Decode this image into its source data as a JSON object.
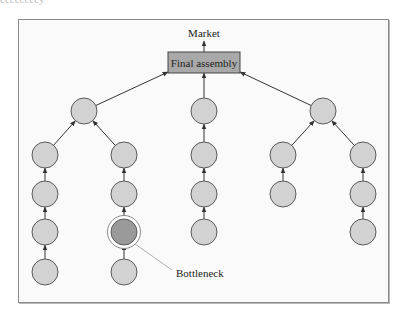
{
  "caption_fragment": "ccccccccy",
  "diagram": {
    "market_label": "Market",
    "final_assembly_label": "Final assembly",
    "bottleneck_label": "Bottleneck",
    "colors": {
      "frame_bg": "#fafafa",
      "node_fill": "#d2d2d2",
      "node_stroke": "#5a5a5a",
      "bottleneck_fill": "#9a9a9a",
      "box_fill": "#a9a9a9",
      "line": "#333333",
      "leader_line": "#b0b0b0"
    },
    "final_assembly_box": {
      "x": 168,
      "y": 52,
      "w": 72,
      "h": 21
    },
    "node_radius": 13,
    "nodes": [
      {
        "id": "top-left",
        "x": 84,
        "y": 111
      },
      {
        "id": "top-mid",
        "x": 204,
        "y": 111
      },
      {
        "id": "top-right",
        "x": 323,
        "y": 111
      },
      {
        "id": "c1-r1",
        "x": 45,
        "y": 155
      },
      {
        "id": "c1-r2",
        "x": 45,
        "y": 194
      },
      {
        "id": "c1-r3",
        "x": 45,
        "y": 232
      },
      {
        "id": "c1-r4",
        "x": 45,
        "y": 272
      },
      {
        "id": "c2-r1",
        "x": 124,
        "y": 155
      },
      {
        "id": "c2-r2",
        "x": 124,
        "y": 194
      },
      {
        "id": "c2-r3",
        "x": 124,
        "y": 232,
        "bottleneck": true
      },
      {
        "id": "c2-r4",
        "x": 124,
        "y": 272
      },
      {
        "id": "c3-r1",
        "x": 204,
        "y": 155
      },
      {
        "id": "c3-r2",
        "x": 204,
        "y": 194
      },
      {
        "id": "c3-r3",
        "x": 204,
        "y": 232
      },
      {
        "id": "c4-r1",
        "x": 283,
        "y": 155
      },
      {
        "id": "c4-r2",
        "x": 283,
        "y": 194
      },
      {
        "id": "c5-r1",
        "x": 363,
        "y": 155
      },
      {
        "id": "c5-r2",
        "x": 363,
        "y": 194
      },
      {
        "id": "c5-r3",
        "x": 363,
        "y": 232
      }
    ],
    "edges": [
      [
        "top-left",
        "final"
      ],
      [
        "top-mid",
        "final"
      ],
      [
        "top-right",
        "final"
      ],
      [
        "c1-r1",
        "top-left"
      ],
      [
        "c2-r1",
        "top-left"
      ],
      [
        "c3-r1",
        "top-mid"
      ],
      [
        "c4-r1",
        "top-right"
      ],
      [
        "c5-r1",
        "top-right"
      ],
      [
        "c1-r2",
        "c1-r1"
      ],
      [
        "c1-r3",
        "c1-r2"
      ],
      [
        "c1-r4",
        "c1-r3"
      ],
      [
        "c2-r2",
        "c2-r1"
      ],
      [
        "c2-r3",
        "c2-r2"
      ],
      [
        "c2-r4",
        "c2-r3"
      ],
      [
        "c3-r2",
        "c3-r1"
      ],
      [
        "c3-r3",
        "c3-r2"
      ],
      [
        "c4-r2",
        "c4-r1"
      ],
      [
        "c5-r2",
        "c5-r1"
      ],
      [
        "c5-r3",
        "c5-r2"
      ]
    ]
  }
}
